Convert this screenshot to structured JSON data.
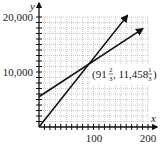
{
  "chart_data": {
    "type": "line",
    "title": "",
    "xlabel": "x",
    "ylabel": "y",
    "xlim": [
      0,
      200
    ],
    "ylim": [
      0,
      20000
    ],
    "x_ticks": [
      100,
      200
    ],
    "x_tick_labels": [
      "100",
      "200"
    ],
    "y_ticks": [
      10000,
      20000
    ],
    "y_tick_labels": [
      "10,000",
      "20,000"
    ],
    "grid": true,
    "x_minor_step": 10,
    "y_minor_step": 1000,
    "series": [
      {
        "name": "steep-line",
        "x": [
          0,
          162
        ],
        "y": [
          0,
          20250
        ],
        "arrow_end": true
      },
      {
        "name": "shallow-line",
        "x": [
          0,
          190
        ],
        "y": [
          5500,
          17850
        ],
        "arrow_end": true
      }
    ],
    "annotations": [
      {
        "text": "(91⅔, 11,458⅓)",
        "x": 91.667,
        "y": 11458.333,
        "label_whole_x": "91",
        "label_num_x": "2",
        "label_den_x": "3",
        "label_whole_y": "11,458",
        "label_num_y": "1",
        "label_den_y": "3"
      }
    ],
    "intersection": {
      "x": 91.667,
      "y": 11458.333
    },
    "legend": null
  },
  "labels": {
    "y_axis": "y",
    "x_axis": "x",
    "y_top": "20,000",
    "y_mid": "10,000",
    "x_mid": "100",
    "x_end": "200",
    "ann_open": "(91",
    "ann_num1": "2",
    "ann_den1": "3",
    "ann_mid": ", 11,458",
    "ann_num2": "1",
    "ann_den2": "3",
    "ann_close": ")"
  }
}
